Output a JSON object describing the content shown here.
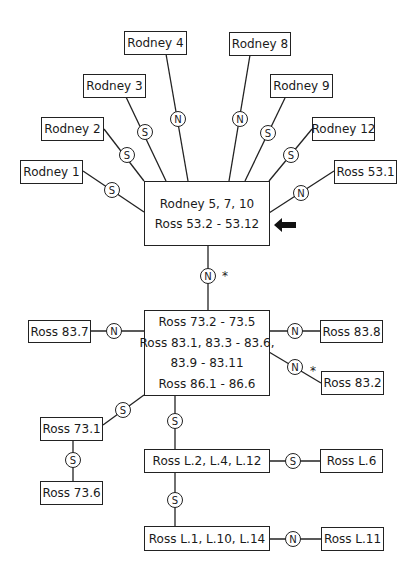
{
  "diagram": {
    "type": "relationship-network",
    "boxes": {
      "rodney4": "Rodney 4",
      "rodney8": "Rodney 8",
      "rodney3": "Rodney 3",
      "rodney9": "Rodney 9",
      "rodney2": "Rodney 2",
      "rodney12": "Rodney 12",
      "rodney1": "Rodney 1",
      "ross531": "Ross 53.1",
      "central_line1": "Rodney 5, 7, 10",
      "central_line2": "Ross 53.2 - 53.12",
      "group2_line1": "Ross 73.2 - 73.5",
      "group2_line2": "Ross 83.1, 83.3 - 83.6,",
      "group2_line3": "83.9 - 83.11",
      "group2_line4": "Ross 86.1 - 86.6",
      "ross837": "Ross 83.7",
      "ross838": "Ross 83.8",
      "ross832": "Ross 83.2",
      "ross731": "Ross 73.1",
      "ross736": "Ross 73.6",
      "rossL2": "Ross L.2, L.4, L.12",
      "rossL6": "Ross L.6",
      "rossL1": "Ross L.1, L.10, L.14",
      "rossL11": "Ross L.11"
    },
    "node_labels": {
      "S": "S",
      "N": "N"
    },
    "star": "*"
  }
}
